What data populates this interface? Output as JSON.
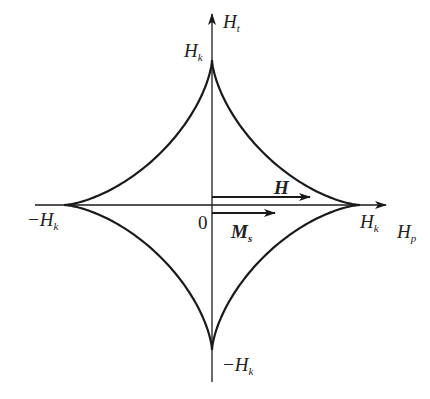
{
  "diagram": {
    "type": "Stoner-Wohlfarth astroid",
    "axes": {
      "horizontal": {
        "symbol": "H",
        "subscript": "p"
      },
      "vertical": {
        "symbol": "H",
        "subscript": "t"
      }
    },
    "labels": {
      "top": {
        "prefix": "",
        "symbol": "H",
        "subscript": "k"
      },
      "bottom": {
        "prefix": "−",
        "symbol": "H",
        "subscript": "k"
      },
      "left": {
        "prefix": "−",
        "symbol": "H",
        "subscript": "k"
      },
      "right": {
        "prefix": "",
        "symbol": "H",
        "subscript": "k"
      },
      "origin": "0"
    },
    "vectors": {
      "field": {
        "symbol": "H",
        "subscript": ""
      },
      "magnetization": {
        "symbol": "M",
        "subscript": "s"
      }
    },
    "colors": {
      "line": "#1a1a1a",
      "background": "#ffffff"
    }
  }
}
